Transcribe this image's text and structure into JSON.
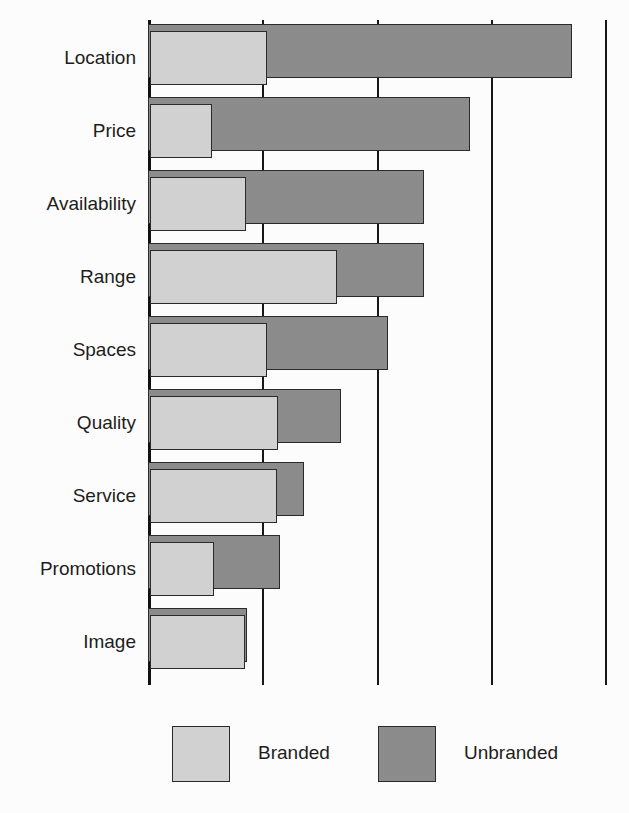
{
  "chart_data": {
    "type": "bar",
    "orientation": "horizontal",
    "title": "",
    "subtitle": "",
    "xlabel": "",
    "ylabel": "",
    "grid": true,
    "gridlines_x": [
      0,
      25,
      50,
      75,
      100
    ],
    "xlim": [
      0,
      100
    ],
    "legend_position": "bottom",
    "categories": [
      "Location",
      "Price",
      "Availability",
      "Range",
      "Spaces",
      "Quality",
      "Service",
      "Promotions",
      "Image"
    ],
    "series": [
      {
        "name": "Branded",
        "color": "#d2d2d2",
        "values": [
          25.6,
          13.5,
          21.0,
          41.0,
          25.6,
          28.0,
          27.8,
          14.0,
          20.8
        ]
      },
      {
        "name": "Unbranded",
        "color": "#8c8c8c",
        "values": [
          92.8,
          70.4,
          60.5,
          60.3,
          52.5,
          42.3,
          34.1,
          28.8,
          21.6
        ]
      }
    ]
  },
  "axis": {
    "tick_positions": [
      0,
      25,
      50,
      75,
      100
    ]
  },
  "legend": {
    "entries": [
      {
        "label": "Branded",
        "swatch": "light-grey-swatch"
      },
      {
        "label": "Unbranded",
        "swatch": "dark-grey-swatch"
      }
    ]
  }
}
